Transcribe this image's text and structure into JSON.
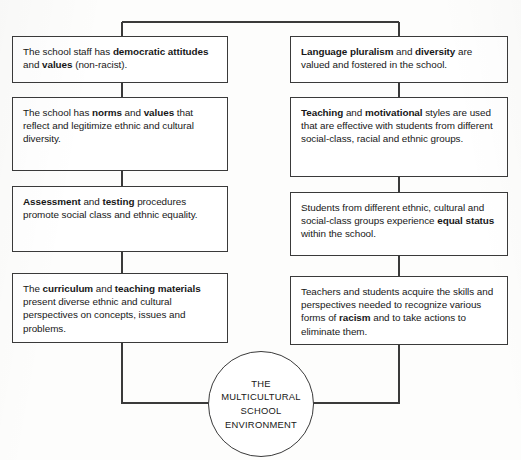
{
  "diagram": {
    "title": "The Multicultural School Environment",
    "center_node": {
      "name": "center-circle",
      "lines": [
        "THE",
        "MULTICULTURAL",
        "SCHOOL",
        "ENVIRONMENT"
      ]
    },
    "left_column": [
      {
        "id": "left-1",
        "segments": [
          {
            "text": "The school staff has ",
            "bold": false
          },
          {
            "text": "democratic attitudes",
            "bold": true
          },
          {
            "text": " and ",
            "bold": false
          },
          {
            "text": "values",
            "bold": true
          },
          {
            "text": " (non-racist).",
            "bold": false
          }
        ]
      },
      {
        "id": "left-2",
        "segments": [
          {
            "text": "The school has ",
            "bold": false
          },
          {
            "text": "norms",
            "bold": true
          },
          {
            "text": " and ",
            "bold": false
          },
          {
            "text": "values",
            "bold": true
          },
          {
            "text": " that reflect and legitimize ethnic and cultural  diversity.",
            "bold": false
          }
        ]
      },
      {
        "id": "left-3",
        "segments": [
          {
            "text": "Assessment",
            "bold": true
          },
          {
            "text": " and ",
            "bold": false
          },
          {
            "text": "testing",
            "bold": true
          },
          {
            "text": " procedures promote social class and ethnic equality.",
            "bold": false
          }
        ]
      },
      {
        "id": "left-4",
        "segments": [
          {
            "text": "The ",
            "bold": false
          },
          {
            "text": "curriculum",
            "bold": true
          },
          {
            "text": " and ",
            "bold": false
          },
          {
            "text": "teaching materials",
            "bold": true
          },
          {
            "text": " present diverse ethnic and cultural perspectives on concepts, issues and problems.",
            "bold": false
          }
        ]
      }
    ],
    "right_column": [
      {
        "id": "right-1",
        "segments": [
          {
            "text": "Language pluralism",
            "bold": true
          },
          {
            "text": " and ",
            "bold": false
          },
          {
            "text": "diversity",
            "bold": true
          },
          {
            "text": " are valued and fostered in the school.",
            "bold": false
          }
        ]
      },
      {
        "id": "right-2",
        "segments": [
          {
            "text": "Teaching",
            "bold": true
          },
          {
            "text": " and ",
            "bold": false
          },
          {
            "text": "motivational",
            "bold": true
          },
          {
            "text": " styles are used that are effective with students from different social-class, racial and ethnic groups.",
            "bold": false
          }
        ]
      },
      {
        "id": "right-3",
        "segments": [
          {
            "text": "Students from different ethnic, cultural and social-class groups experience ",
            "bold": false
          },
          {
            "text": "equal status",
            "bold": true
          },
          {
            "text": " within the school.",
            "bold": false
          }
        ]
      },
      {
        "id": "right-4",
        "segments": [
          {
            "text": "Teachers and students acquire the skills and perspectives needed to recognize various forms of ",
            "bold": false
          },
          {
            "text": "racism",
            "bold": true
          },
          {
            "text": " and to take actions to eliminate them.",
            "bold": false
          }
        ]
      }
    ],
    "colors": {
      "line": "#3a3a3a",
      "box_fill": "#ffffff",
      "text": "#171717",
      "page_background": "#fdfdfc"
    }
  }
}
